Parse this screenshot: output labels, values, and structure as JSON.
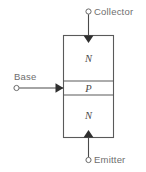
{
  "diagram": {
    "type": "semiconductor-layer-diagram",
    "colors": {
      "background": "#ffffff",
      "outline": "#5a5a5a",
      "lead": "#4a4a4a",
      "arrow_fill": "#2f2f2f",
      "terminal_stroke": "#6a6a6a",
      "label_text": "#6e6e6e",
      "region_text": "#4a4a4a"
    },
    "terminals": [
      {
        "id": "collector",
        "label": "Collector",
        "position": "top",
        "dot": {
          "cx": 88.5,
          "cy": 11.5,
          "r": 2.6
        },
        "lead": {
          "x1": 88.5,
          "y1": 14.2,
          "x2": 88.5,
          "y2": 35.5
        },
        "label_pos": {
          "x": 94,
          "y": 14.5
        },
        "arrow": {
          "points": "83.5,35.5 93.5,35.5 88.5,43.0"
        }
      },
      {
        "id": "base",
        "label": "Base",
        "position": "left",
        "dot": {
          "cx": 16.5,
          "cy": 88.0,
          "r": 2.6
        },
        "lead": {
          "x1": 19.2,
          "y1": 88.0,
          "x2": 63.5,
          "y2": 88.0
        },
        "label_pos": {
          "x": 14,
          "y": 79.5
        },
        "arrow": {
          "points": "55.5,83.2 55.5,92.8 63.5,88.0"
        }
      },
      {
        "id": "emitter",
        "label": "Emitter",
        "position": "bottom",
        "dot": {
          "cx": 88.5,
          "cy": 160.0,
          "r": 2.6
        },
        "lead": {
          "x1": 88.5,
          "y1": 157.4,
          "x2": 88.5,
          "y2": 137.5
        },
        "label_pos": {
          "x": 94,
          "y": 163.0
        },
        "arrow": {
          "points": "83.5,137.5 93.5,137.5 88.5,130.0"
        }
      }
    ],
    "body": {
      "x": 63.5,
      "y": 35.5,
      "width": 50,
      "height": 102
    },
    "regions": [
      {
        "id": "collector-region",
        "label": "N",
        "material": "n-type",
        "y_top": 35.5,
        "y_bottom": 81.0,
        "label_x": 88.5,
        "label_y": 62.0
      },
      {
        "id": "base-region",
        "label": "P",
        "material": "p-type",
        "y_top": 81.0,
        "y_bottom": 95.0,
        "label_x": 88.5,
        "label_y": 92.0
      },
      {
        "id": "emitter-region",
        "label": "N",
        "material": "n-type",
        "y_top": 95.0,
        "y_bottom": 137.5,
        "label_x": 88.5,
        "label_y": 119.0
      }
    ],
    "dividers": [
      {
        "id": "collector-base-junction",
        "y": 81.0
      },
      {
        "id": "base-emitter-junction",
        "y": 95.0
      }
    ]
  }
}
